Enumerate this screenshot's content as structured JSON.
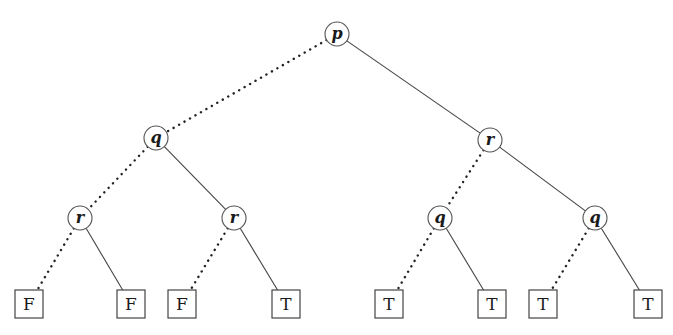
{
  "diagram": {
    "type": "binary-decision-tree",
    "legend_note": "dotted edge = false branch, solid edge = true branch",
    "nodes": [
      {
        "id": "n0",
        "label": "p",
        "x": 337,
        "y": 34
      },
      {
        "id": "n1",
        "label": "q",
        "x": 156,
        "y": 138
      },
      {
        "id": "n2",
        "label": "r",
        "x": 490,
        "y": 140
      },
      {
        "id": "n3",
        "label": "r",
        "x": 80,
        "y": 218
      },
      {
        "id": "n4",
        "label": "r",
        "x": 234,
        "y": 218
      },
      {
        "id": "n5",
        "label": "q",
        "x": 440,
        "y": 218
      },
      {
        "id": "n6",
        "label": "q",
        "x": 595,
        "y": 218
      }
    ],
    "leaves": [
      {
        "id": "l0",
        "label": "F",
        "x": 29,
        "y": 304
      },
      {
        "id": "l1",
        "label": "F",
        "x": 131,
        "y": 304
      },
      {
        "id": "l2",
        "label": "F",
        "x": 182,
        "y": 304
      },
      {
        "id": "l3",
        "label": "T",
        "x": 286,
        "y": 304
      },
      {
        "id": "l4",
        "label": "T",
        "x": 389,
        "y": 304
      },
      {
        "id": "l5",
        "label": "T",
        "x": 492,
        "y": 304
      },
      {
        "id": "l6",
        "label": "T",
        "x": 543,
        "y": 304
      },
      {
        "id": "l7",
        "label": "T",
        "x": 648,
        "y": 304
      }
    ],
    "edges": [
      {
        "from": "n0",
        "to": "n1",
        "style": "dotted"
      },
      {
        "from": "n0",
        "to": "n2",
        "style": "solid"
      },
      {
        "from": "n1",
        "to": "n3",
        "style": "dotted"
      },
      {
        "from": "n1",
        "to": "n4",
        "style": "solid"
      },
      {
        "from": "n2",
        "to": "n5",
        "style": "dotted"
      },
      {
        "from": "n2",
        "to": "n6",
        "style": "solid"
      },
      {
        "from": "n3",
        "to": "l0",
        "style": "dotted"
      },
      {
        "from": "n3",
        "to": "l1",
        "style": "solid"
      },
      {
        "from": "n4",
        "to": "l2",
        "style": "dotted"
      },
      {
        "from": "n4",
        "to": "l3",
        "style": "solid"
      },
      {
        "from": "n5",
        "to": "l4",
        "style": "dotted"
      },
      {
        "from": "n5",
        "to": "l5",
        "style": "solid"
      },
      {
        "from": "n6",
        "to": "l6",
        "style": "dotted"
      },
      {
        "from": "n6",
        "to": "l7",
        "style": "solid"
      }
    ]
  }
}
